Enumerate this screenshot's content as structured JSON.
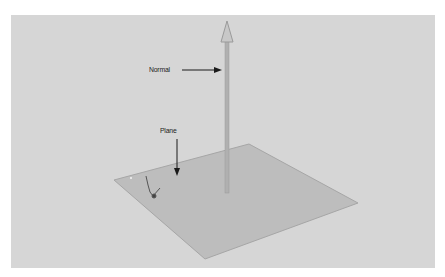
{
  "figure": {
    "labels": {
      "normal": "Normal",
      "plane": "Plane"
    },
    "colors": {
      "background": "#d6d6d6",
      "plane_fill": "#bcbcbc",
      "plane_edge": "#a8a8a8",
      "normal_arrow": "#b4b4b4",
      "annotation": "#1a1a1a"
    },
    "objects": [
      {
        "name": "plane",
        "vertices": [
          [
            114,
            180
          ],
          [
            249,
            144
          ],
          [
            358,
            203
          ],
          [
            205,
            259
          ]
        ]
      },
      {
        "name": "normal-vector",
        "from": [
          227,
          192
        ],
        "to": [
          227,
          22
        ]
      },
      {
        "name": "transform-gizmo",
        "at": [
          150,
          190
        ]
      }
    ]
  }
}
